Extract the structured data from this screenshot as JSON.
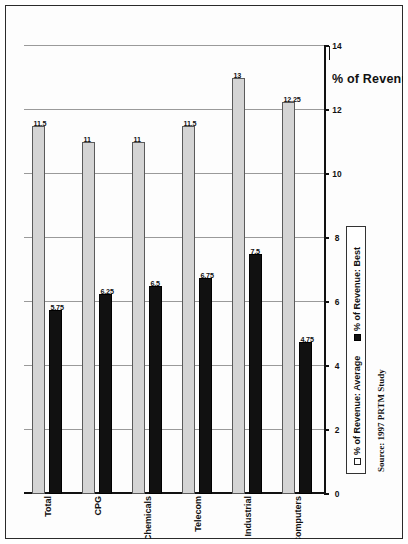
{
  "page": {
    "source_note": "Source: 1997 PRTM Study"
  },
  "legend": {
    "items": [
      {
        "label": "% of Revenue: Average",
        "swatch": "open-square-icon",
        "color": "#d4d4d4"
      },
      {
        "label": "% of Revenue: Best",
        "swatch": "filled-square-icon",
        "color": "#111111"
      }
    ]
  },
  "chart_data": {
    "type": "bar",
    "orientation": "horizontal",
    "title": "",
    "xlabel": "% of Revenue",
    "ylabel": "",
    "xlim": [
      0,
      14
    ],
    "xticks": [
      "0",
      "2",
      "4",
      "6",
      "8",
      "10",
      "12",
      "14"
    ],
    "grid": true,
    "legend_position": "bottom-left",
    "categories": [
      "Computers",
      "Industrial",
      "Telecom",
      "Chemicals",
      "CPG",
      "Total"
    ],
    "series": [
      {
        "name": "% of Revenue: Average",
        "color": "#d4d4d4",
        "values": [
          12.25,
          13,
          11.5,
          11,
          11,
          11.5
        ],
        "labels": [
          "12.25",
          "13",
          "11.5",
          "11",
          "11",
          "11.5"
        ]
      },
      {
        "name": "% of Revenue: Best",
        "color": "#111111",
        "values": [
          4.75,
          7.5,
          6.75,
          6.5,
          6.25,
          5.75
        ],
        "labels": [
          "4.75",
          "7.5",
          "6.75",
          "6.5",
          "6.25",
          "5.75"
        ]
      }
    ]
  }
}
